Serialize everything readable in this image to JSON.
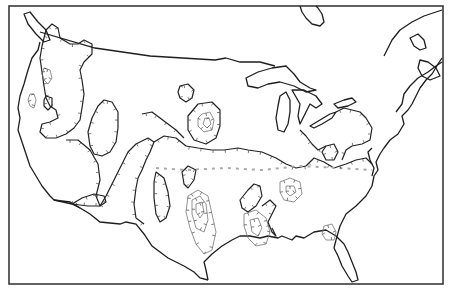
{
  "map": {
    "subject": "Contiguous United States with hachured isoline contours",
    "region": "United States",
    "labels": [],
    "features": [
      {
        "name": "coastline-and-borders",
        "kind": "outline"
      },
      {
        "name": "closed-contours",
        "kind": "hachured isolines"
      },
      {
        "name": "concentric-contour-centers",
        "kind": "local extrema",
        "locations": [
          "Northern Plains",
          "Texas",
          "Louisiana/Mississippi",
          "Tennessee/Alabama",
          "Georgia/Florida"
        ]
      }
    ],
    "colors": {
      "line": "#1e1e1e",
      "background": "#ffffff",
      "secondary_line": "#777777"
    }
  }
}
